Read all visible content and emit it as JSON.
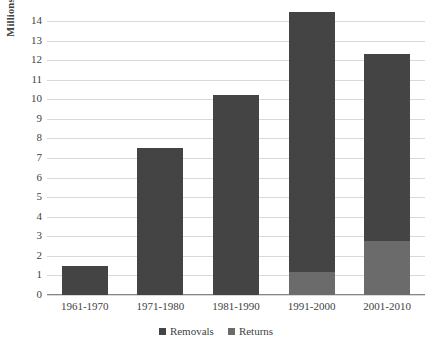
{
  "chart_data": {
    "type": "bar",
    "subtype": "stacked-bar",
    "title": "",
    "xlabel": "",
    "ylabel": "Millions",
    "ylim": [
      0,
      14
    ],
    "ytick_step": 1,
    "yticks": [
      14,
      13,
      12,
      11,
      10,
      9,
      8,
      7,
      6,
      5,
      4,
      3,
      2,
      1,
      0
    ],
    "grid": true,
    "legend_position": "bottom",
    "categories": [
      "1961-1970",
      "1971-1980",
      "1981-1990",
      "1991-2000",
      "2001-2010"
    ],
    "series": [
      {
        "name": "Removals",
        "color": "#444444",
        "values": [
          1.5,
          7.5,
          10.2,
          13.25,
          9.55
        ]
      },
      {
        "name": "Returns",
        "color": "#6b6b6b",
        "values": [
          0,
          0,
          0,
          1.2,
          2.75
        ]
      }
    ],
    "totals": [
      1.5,
      7.5,
      10.2,
      14.45,
      12.3
    ]
  },
  "axes": {
    "y_title": "Millions",
    "grid_color": "#d9d9d9",
    "baseline_color": "#868686"
  },
  "legend": {
    "items": [
      {
        "label": "Removals",
        "color": "#444444"
      },
      {
        "label": "Returns",
        "color": "#6b6b6b"
      }
    ]
  }
}
